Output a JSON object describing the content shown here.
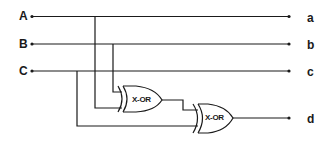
{
  "diagram": {
    "type": "logic-circuit",
    "inputs": [
      {
        "label": "A",
        "y": 16
      },
      {
        "label": "B",
        "y": 44
      },
      {
        "label": "C",
        "y": 71
      }
    ],
    "outputs": [
      {
        "label": "a",
        "y": 16
      },
      {
        "label": "b",
        "y": 44
      },
      {
        "label": "c",
        "y": 71
      },
      {
        "label": "d",
        "y": 118
      }
    ],
    "gates": [
      {
        "id": "gate1",
        "type": "XOR",
        "label": "X-OR",
        "inputs": [
          "A",
          "B"
        ]
      },
      {
        "id": "gate2",
        "type": "XOR",
        "label": "X-OR",
        "inputs": [
          "gate1",
          "C"
        ],
        "output": "d"
      }
    ],
    "colors": {
      "line": "#1a1a1a",
      "background": "#ffffff"
    }
  }
}
